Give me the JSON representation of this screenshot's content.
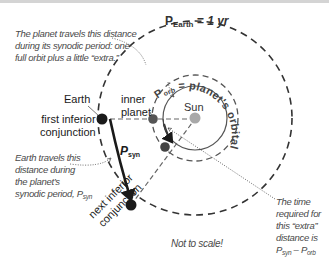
{
  "title_label": {
    "symbol": "P",
    "subscript": "Earth",
    "rest": " = 1 yr"
  },
  "orbital_period_label": {
    "symbol": "P",
    "subscript": "orb",
    "rest": " = planet's orbital period"
  },
  "labels": {
    "sun": "Sun",
    "earth": "Earth",
    "inner_planet_line1": "inner",
    "inner_planet_line2": "planet",
    "first_conj_line1": "first inferior",
    "first_conj_line2": "conjunction",
    "next_conj_line1": "next inferior",
    "next_conj_line2": "conjunction",
    "psyn_symbol": "P",
    "psyn_subscript": "syn",
    "not_to_scale": "Not to scale!"
  },
  "notes": {
    "planet_travels": [
      "The planet travels this distance",
      "during its synodic period: one",
      "full orbit plus a little “extra.”"
    ],
    "earth_travels": [
      "Earth travels this",
      "distance during",
      "the planet’s"
    ],
    "earth_travels_last": {
      "text": "synodic period, P",
      "subscript": "syn"
    },
    "time_required": [
      "The time",
      "required for",
      "this “extra”",
      "distance is"
    ],
    "time_required_formula": {
      "p1": "P",
      "s1": "syn",
      "minus": " – ",
      "p2": "P",
      "s2": "orb"
    }
  },
  "colors": {
    "earth_dot": "#1a1a1a",
    "inner_planet_dot": "#5a5a5a",
    "sun_dot": "#a8a8a8",
    "orbit_line": "#3a3a3a",
    "note_text": "#4a4a4a"
  }
}
